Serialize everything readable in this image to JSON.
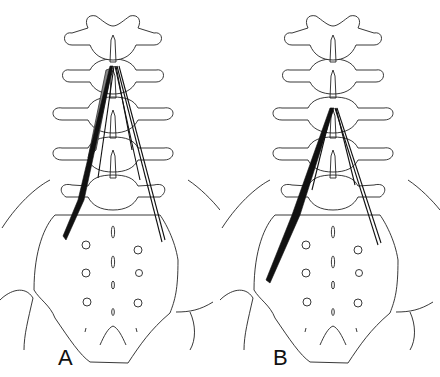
{
  "figure": {
    "panels": [
      {
        "id": "A",
        "label": "A"
      },
      {
        "id": "B",
        "label": "B"
      }
    ],
    "colors": {
      "line": "#222222",
      "muscle": "#111111",
      "muscle_shaded": "#888888",
      "background": "#ffffff"
    }
  }
}
